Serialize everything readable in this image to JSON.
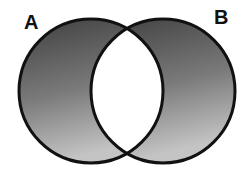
{
  "diagram": {
    "type": "venn",
    "sets": [
      {
        "id": "A",
        "label": "A",
        "shaded": true
      },
      {
        "id": "B",
        "label": "B",
        "shaded": true
      }
    ],
    "intersection": {
      "sets": [
        "A",
        "B"
      ],
      "shaded": false
    },
    "colors": {
      "fill_top": "#454545",
      "fill_bottom": "#bdbdbd",
      "outline": "#111111",
      "intersection": "#ffffff",
      "background": "#ffffff"
    }
  }
}
